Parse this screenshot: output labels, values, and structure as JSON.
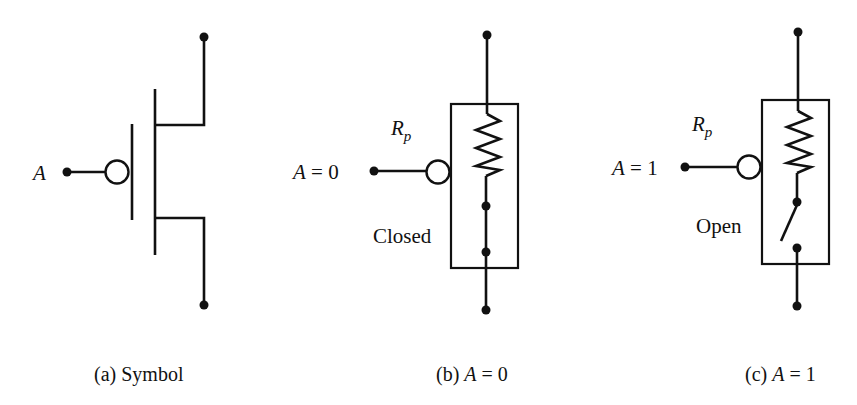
{
  "figure": {
    "panels": [
      {
        "id": "a",
        "input_label": "A",
        "caption_prefix": "(a) ",
        "caption_text": "Symbol"
      },
      {
        "id": "b",
        "input_label_var": "A",
        "input_label_eq": " = 0",
        "resistor_label": "R",
        "resistor_subscript": "p",
        "switch_state": "Closed",
        "caption_prefix": "(b) ",
        "caption_var": "A",
        "caption_eq": " = 0"
      },
      {
        "id": "c",
        "input_label_var": "A",
        "input_label_eq": " = 1",
        "resistor_label": "R",
        "resistor_subscript": "p",
        "switch_state": "Open",
        "caption_prefix": "(c) ",
        "caption_var": "A",
        "caption_eq": " = 1"
      }
    ]
  }
}
